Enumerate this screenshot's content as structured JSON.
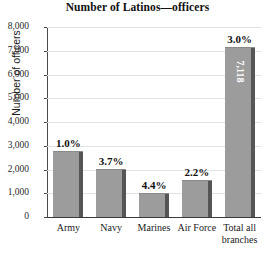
{
  "chart_data": {
    "type": "bar",
    "title": "Number of Latinos—officers",
    "xlabel": "",
    "ylabel": "Number of officers",
    "categories": [
      "Army",
      "Navy",
      "Marines",
      "Air Force",
      "Total all branches"
    ],
    "values": [
      2750,
      2000,
      950,
      1500,
      7118
    ],
    "point_labels": [
      "1.0%",
      "3.7%",
      "4.4%",
      "2.2%",
      "3.0%"
    ],
    "bar_value_labels": [
      "",
      "",
      "",
      "",
      "7,118"
    ],
    "ylim": [
      0,
      8000
    ],
    "yticks": [
      0,
      1000,
      2000,
      3000,
      4000,
      5000,
      6000,
      7000,
      8000
    ],
    "ytick_labels": [
      "0",
      "1,000",
      "2,000",
      "3,000",
      "4,000",
      "5,000",
      "6,000",
      "7,000",
      "8,000"
    ],
    "grid": true,
    "legend": false,
    "bar_color": "#9c9c9c",
    "bar_edge_color": "#555555",
    "gridline_color": "#e2e2e2",
    "axis_color": "#3a3a3a"
  }
}
